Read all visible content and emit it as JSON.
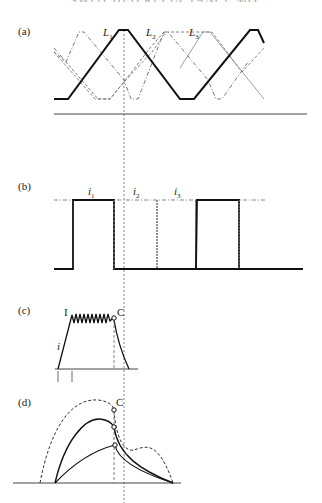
{
  "header": {
    "text": "SWITCHED RELUCTANCE MOTOR DRIVES"
  },
  "panels": {
    "a": {
      "label": "(a)",
      "curves": [
        {
          "name": "L",
          "sub": "1"
        },
        {
          "name": "L",
          "sub": "2"
        },
        {
          "name": "L",
          "sub": "3"
        }
      ]
    },
    "b": {
      "label": "(b)",
      "currents": [
        {
          "name": "i",
          "sub": "1"
        },
        {
          "name": "i",
          "sub": "2"
        },
        {
          "name": "i",
          "sub": "3"
        }
      ]
    },
    "c": {
      "label": "(c)",
      "level_label": "I",
      "commutation_label": "C",
      "current_label": "i"
    },
    "d": {
      "label": "(d)",
      "commutation_label": "C"
    }
  },
  "colors": {
    "ink": "#1a1a1a",
    "dashed": "#555555",
    "axis": "#444444"
  }
}
